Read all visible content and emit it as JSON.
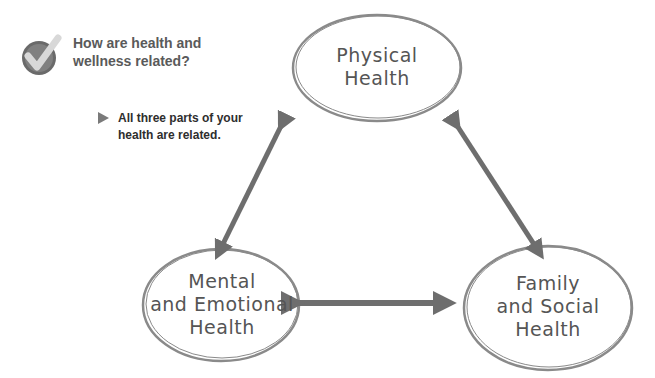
{
  "question": {
    "icon": "checkmark-icon",
    "line1": "How are health and",
    "line2": "wellness related?"
  },
  "note": {
    "icon": "triangle-bullet-icon",
    "line1": "All three parts of your",
    "line2": "health are related."
  },
  "nodes": [
    {
      "id": "physical",
      "line1": "Physical",
      "line2": "Health"
    },
    {
      "id": "mental",
      "line1": "Mental",
      "line2": "and Emotional",
      "line3": "Health"
    },
    {
      "id": "family",
      "line1": "Family",
      "line2": "and Social",
      "line3": "Health"
    }
  ],
  "edges": [
    {
      "from": "physical",
      "to": "mental",
      "type": "double-arrow"
    },
    {
      "from": "physical",
      "to": "family",
      "type": "double-arrow"
    },
    {
      "from": "mental",
      "to": "family",
      "type": "double-arrow"
    }
  ],
  "colors": {
    "outline": "#8a8a8a",
    "arrow": "#6e6e6e",
    "text": "#555555"
  }
}
